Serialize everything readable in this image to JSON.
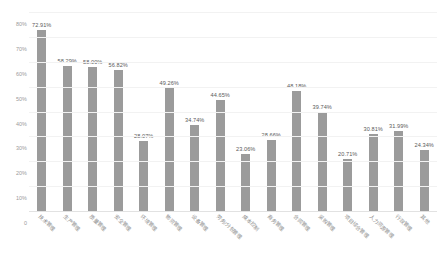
{
  "chart_data": {
    "type": "bar",
    "title": "",
    "subtitle": "",
    "xlabel": "",
    "ylabel": "",
    "ylim": [
      0,
      0.8
    ],
    "grid": true,
    "legend": false,
    "value_format": "percent",
    "bar_color": "#9b9b9b",
    "label_color": "#5a5a5a",
    "axis_color": "#9a9a9a",
    "gridline_color": "#f2f2f2",
    "ytick_labels": [
      "80%",
      "70%",
      "60%",
      "50%",
      "40%",
      "30%",
      "20%",
      "10%",
      "0"
    ],
    "ytick_values": [
      0.8,
      0.7,
      0.6,
      0.5,
      0.4,
      0.3,
      0.2,
      0.1,
      0.0
    ],
    "categories": [
      "技术管理",
      "生产管理",
      "质量管理",
      "安全管理",
      "环境管理",
      "物资管理",
      "设备管理",
      "劳务/分包管理",
      "成本控制",
      "商务管理",
      "合同管理",
      "采购管理",
      "项目综合管理",
      "人力资源管理",
      "行政管理",
      "其他"
    ],
    "values": [
      72.91,
      58.29,
      58.0,
      56.82,
      28.07,
      49.26,
      34.74,
      44.65,
      23.06,
      28.66,
      48.18,
      39.74,
      20.71,
      30.81,
      31.99,
      24.34
    ],
    "data_labels": [
      "72.91%",
      "58.29%",
      "58.00%",
      "56.82%",
      "28.07%",
      "49.26%",
      "34.74%",
      "44.65%",
      "23.06%",
      "28.66%",
      "48.18%",
      "39.74%",
      "20.71%",
      "30.81%",
      "31.99%",
      "24.34%"
    ]
  }
}
